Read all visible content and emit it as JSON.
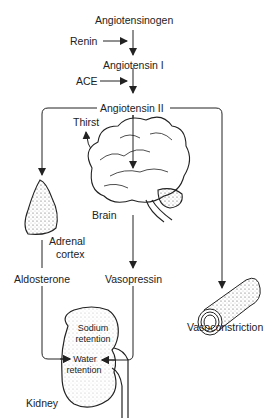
{
  "diagram": {
    "nodes": {
      "angiotensinogen": "Angiotensinogen",
      "renin": "Renin",
      "angiotensin_i": "Angiotensin I",
      "ace": "ACE",
      "angiotensin_ii": "Angiotensin II",
      "thirst": "Thirst",
      "brain": "Brain",
      "adrenal_cortex_1": "Adrenal",
      "adrenal_cortex_2": "cortex",
      "aldosterone": "Aldosterone",
      "vasopressin": "Vasopressin",
      "vasoconstriction": "Vasoconstriction",
      "sodium_retention_1": "Sodium",
      "sodium_retention_2": "retention",
      "water_retention_1": "Water",
      "water_retention_2": "retention",
      "kidney": "Kidney"
    },
    "edges": [
      {
        "from": "Angiotensinogen",
        "to": "Angiotensin I",
        "via": "Renin"
      },
      {
        "from": "Angiotensin I",
        "to": "Angiotensin II",
        "via": "ACE"
      },
      {
        "from": "Angiotensin II",
        "to": "Adrenal cortex"
      },
      {
        "from": "Angiotensin II",
        "to": "Brain"
      },
      {
        "from": "Angiotensin II",
        "to": "Vasoconstriction"
      },
      {
        "from": "Brain",
        "to": "Thirst"
      },
      {
        "from": "Brain",
        "to": "Vasopressin"
      },
      {
        "from": "Adrenal cortex",
        "to": "Aldosterone"
      },
      {
        "from": "Aldosterone",
        "to": "Sodium retention"
      },
      {
        "from": "Vasopressin",
        "to": "Water retention"
      }
    ],
    "colors": {
      "line": "#222222",
      "background": "#ffffff"
    }
  }
}
